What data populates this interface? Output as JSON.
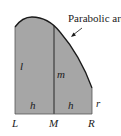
{
  "figure": {
    "annotation": "Parabolic arc",
    "labels": {
      "left_height": "l",
      "middle_height": "m",
      "right_height": "r",
      "left_width": "h",
      "right_width": "h",
      "point_left": "L",
      "point_middle": "M",
      "point_right": "R"
    },
    "colors": {
      "fill": "#a6a6a6",
      "stroke": "#1a1a1a",
      "background": "#ffffff"
    }
  }
}
